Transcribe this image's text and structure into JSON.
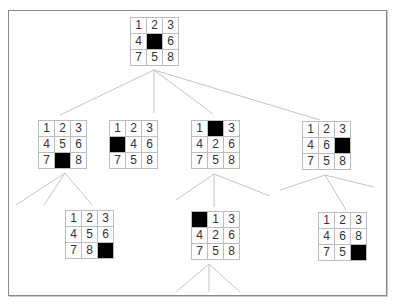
{
  "diagram": {
    "blank_color": "#000000",
    "nodes": [
      {
        "id": "root",
        "level": 0,
        "tiles": [
          1,
          2,
          3,
          4,
          null,
          6,
          7,
          5,
          8
        ]
      },
      {
        "id": "c1",
        "level": 1,
        "parent": "root",
        "tiles": [
          1,
          2,
          3,
          4,
          5,
          6,
          7,
          null,
          8
        ]
      },
      {
        "id": "c2",
        "level": 1,
        "parent": "root",
        "tiles": [
          1,
          2,
          3,
          null,
          4,
          6,
          7,
          5,
          8
        ]
      },
      {
        "id": "c3",
        "level": 1,
        "parent": "root",
        "tiles": [
          1,
          null,
          3,
          4,
          2,
          6,
          7,
          5,
          8
        ]
      },
      {
        "id": "c4",
        "level": 1,
        "parent": "root",
        "tiles": [
          1,
          2,
          3,
          4,
          6,
          null,
          7,
          5,
          8
        ]
      },
      {
        "id": "g1",
        "level": 2,
        "parent": "c1",
        "tiles": [
          1,
          2,
          3,
          4,
          5,
          6,
          7,
          8,
          null
        ]
      },
      {
        "id": "g3",
        "level": 2,
        "parent": "c3",
        "tiles": [
          null,
          1,
          3,
          4,
          2,
          6,
          7,
          5,
          8
        ]
      },
      {
        "id": "g4",
        "level": 2,
        "parent": "c4",
        "tiles": [
          1,
          2,
          3,
          4,
          6,
          8,
          7,
          5,
          null
        ]
      }
    ]
  }
}
